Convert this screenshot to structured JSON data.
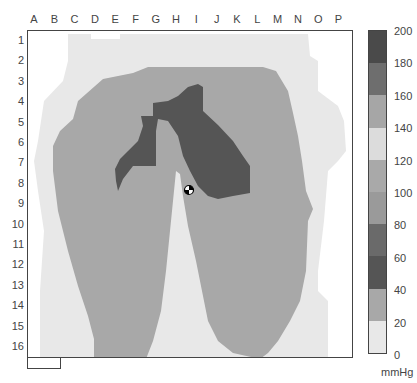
{
  "chart_data": {
    "type": "heatmap",
    "title": "",
    "x_labels": [
      "A",
      "B",
      "C",
      "D",
      "E",
      "F",
      "G",
      "H",
      "I",
      "J",
      "K",
      "L",
      "M",
      "N",
      "O",
      "P"
    ],
    "y_labels": [
      "1",
      "2",
      "3",
      "4",
      "5",
      "6",
      "7",
      "8",
      "9",
      "10",
      "11",
      "12",
      "13",
      "14",
      "15",
      "16"
    ],
    "colorbar": {
      "unit": "mmHg",
      "ticks": [
        200,
        180,
        160,
        140,
        120,
        100,
        80,
        60,
        40,
        20,
        0
      ],
      "range": [
        0,
        200
      ],
      "bands": [
        {
          "from": 180,
          "to": 200,
          "color": "#4a4a4a"
        },
        {
          "from": 160,
          "to": 180,
          "color": "#6e6e6e"
        },
        {
          "from": 140,
          "to": 160,
          "color": "#a6a6a6"
        },
        {
          "from": 120,
          "to": 140,
          "color": "#dcdcdc"
        },
        {
          "from": 100,
          "to": 120,
          "color": "#a9a9a9"
        },
        {
          "from": 80,
          "to": 100,
          "color": "#9a9a9a"
        },
        {
          "from": 60,
          "to": 80,
          "color": "#6a6a6a"
        },
        {
          "from": 40,
          "to": 60,
          "color": "#555555"
        },
        {
          "from": 20,
          "to": 40,
          "color": "#a8a8a8"
        },
        {
          "from": 0,
          "to": 20,
          "color": "#e8e8e8"
        }
      ]
    },
    "regions": [
      {
        "name": "background low pressure",
        "range_mmHg": "0-20",
        "extent": "rows 1-16, cols B-O"
      },
      {
        "name": "main contact area",
        "range_mmHg": "20-40",
        "extent": "rows 2-16, cols C-N, two thigh lobes"
      },
      {
        "name": "peak pressure zone",
        "range_mmHg": "40-60",
        "extent": "rows 3-8, cols E-L, inverted V shape"
      }
    ],
    "center_marker": {
      "col": "H",
      "row": 8.5
    }
  },
  "legend": {
    "ticks": [
      "200",
      "180",
      "160",
      "140",
      "120",
      "100",
      "80",
      "60",
      "40",
      "20",
      "0"
    ],
    "unit": "mmHg"
  },
  "axes": {
    "columns": [
      "A",
      "B",
      "C",
      "D",
      "E",
      "F",
      "G",
      "H",
      "I",
      "J",
      "K",
      "L",
      "M",
      "N",
      "O",
      "P"
    ],
    "rows": [
      "1",
      "2",
      "3",
      "4",
      "5",
      "6",
      "7",
      "8",
      "9",
      "10",
      "11",
      "12",
      "13",
      "14",
      "15",
      "16"
    ]
  }
}
